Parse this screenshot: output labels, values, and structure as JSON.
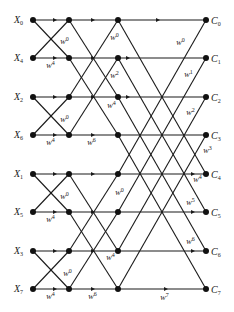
{
  "inputs": [
    {
      "label": "X",
      "sub": "0"
    },
    {
      "label": "X",
      "sub": "4"
    },
    {
      "label": "X",
      "sub": "2"
    },
    {
      "label": "X",
      "sub": "6"
    },
    {
      "label": "X",
      "sub": "1"
    },
    {
      "label": "X",
      "sub": "5"
    },
    {
      "label": "X",
      "sub": "3"
    },
    {
      "label": "X",
      "sub": "7"
    }
  ],
  "outputs": [
    {
      "label": "C",
      "sub": "0"
    },
    {
      "label": "C",
      "sub": "1"
    },
    {
      "label": "C",
      "sub": "2"
    },
    {
      "label": "C",
      "sub": "3"
    },
    {
      "label": "C",
      "sub": "4"
    },
    {
      "label": "C",
      "sub": "5"
    },
    {
      "label": "C",
      "sub": "6"
    },
    {
      "label": "C",
      "sub": "7"
    }
  ],
  "twiddles": {
    "stage1": [
      {
        "label": "W",
        "sup": "0"
      },
      {
        "label": "W",
        "sup": "4"
      },
      {
        "label": "W",
        "sup": "0"
      },
      {
        "label": "W",
        "sup": "4"
      },
      {
        "label": "W",
        "sup": "0"
      },
      {
        "label": "W",
        "sup": "4"
      },
      {
        "label": "W",
        "sup": "0"
      },
      {
        "label": "W",
        "sup": "4"
      }
    ],
    "stage2": [
      {
        "label": "W",
        "sup": "0"
      },
      {
        "label": "W",
        "sup": "2"
      },
      {
        "label": "W",
        "sup": "4"
      },
      {
        "label": "W",
        "sup": "6"
      },
      {
        "label": "W",
        "sup": "0"
      },
      {
        "label": "W",
        "sup": "4"
      },
      {
        "label": "W",
        "sup": "6"
      }
    ],
    "stage3": [
      {
        "label": "W",
        "sup": "0"
      },
      {
        "label": "W",
        "sup": "1"
      },
      {
        "label": "W",
        "sup": "2"
      },
      {
        "label": "W",
        "sup": "3"
      },
      {
        "label": "W",
        "sup": "4"
      },
      {
        "label": "W",
        "sup": "5"
      },
      {
        "label": "W",
        "sup": "6"
      },
      {
        "label": "W",
        "sup": "7"
      }
    ]
  }
}
